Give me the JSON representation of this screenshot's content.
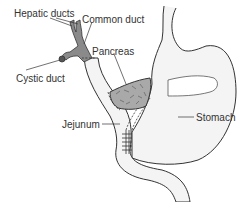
{
  "diagram": {
    "labels": {
      "hepatic_ducts": "Hepatic ducts",
      "common_duct": "Common duct",
      "cystic_duct": "Cystic duct",
      "pancreas": "Pancreas",
      "jejunum": "Jejunum",
      "stomach": "Stomach"
    },
    "colors": {
      "outline": "#333333",
      "organ_fill": "#f2f2f2",
      "duct_fill": "#8a8a8a",
      "pancreas_fill": "#a9a9a9",
      "background": "#ffffff"
    }
  }
}
